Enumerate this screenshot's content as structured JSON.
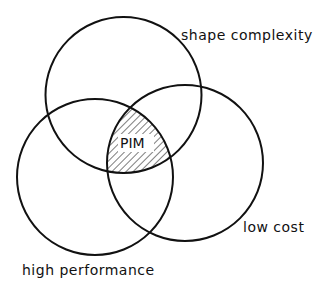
{
  "diagram": {
    "type": "venn",
    "sets": [
      {
        "id": "top",
        "label": "shape complexity",
        "cx": 123.5,
        "cy": 95,
        "r": 78
      },
      {
        "id": "left",
        "label": "high performance",
        "cx": 95,
        "cy": 177,
        "r": 78
      },
      {
        "id": "right",
        "label": "low cost",
        "cx": 185,
        "cy": 163,
        "r": 78
      }
    ],
    "intersection": {
      "label": "PIM",
      "pattern": "diagonal-hatch"
    },
    "colors": {
      "stroke": "#111111",
      "background": "#ffffff"
    }
  }
}
